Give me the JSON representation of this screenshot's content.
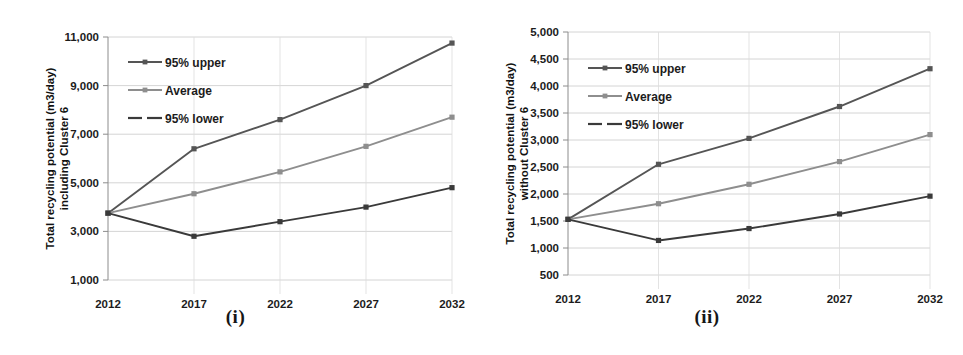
{
  "figure": {
    "panels": [
      {
        "caption": "(i)",
        "ylabel_line1": "Total recycling potential (m3/day)",
        "ylabel_line2": "including Cluster 6",
        "xlabel": "Year"
      },
      {
        "caption": "(ii)",
        "ylabel_line1": "Total recycling potential (m3/day)",
        "ylabel_line2": "without Cluster 6",
        "xlabel": "Year"
      }
    ]
  },
  "chart_data": [
    {
      "type": "line",
      "title": "(i)",
      "xlabel": "Year",
      "ylabel": "Total recycling potential (m3/day) including Cluster 6",
      "categories": [
        "2012",
        "2017",
        "2022",
        "2027",
        "2032"
      ],
      "x": [
        2012,
        2017,
        2022,
        2027,
        2032
      ],
      "ylim": [
        1000,
        11000
      ],
      "yticks": [
        1000,
        3000,
        5000,
        7000,
        9000,
        11000
      ],
      "ytick_labels": [
        "1,000",
        "3,000",
        "5,000",
        "7,000",
        "9,000",
        "11,000"
      ],
      "grid": true,
      "legend_position": "upper-left",
      "series": [
        {
          "name": "95% upper",
          "color": "#555555",
          "values": [
            3750,
            6400,
            7600,
            9000,
            10750
          ]
        },
        {
          "name": "Average",
          "color": "#8e8e8e",
          "values": [
            3750,
            4550,
            5450,
            6500,
            7700
          ]
        },
        {
          "name": "95% lower",
          "color": "#3a3a3a",
          "values": [
            3750,
            2800,
            3400,
            4000,
            4800
          ]
        }
      ]
    },
    {
      "type": "line",
      "title": "(ii)",
      "xlabel": "Year",
      "ylabel": "Total recycling potential (m3/day) without Cluster 6",
      "categories": [
        "2012",
        "2017",
        "2022",
        "2027",
        "2032"
      ],
      "x": [
        2012,
        2017,
        2022,
        2027,
        2032
      ],
      "ylim": [
        500,
        5000
      ],
      "yticks": [
        500,
        1000,
        1500,
        2000,
        2500,
        3000,
        3500,
        4000,
        4500,
        5000
      ],
      "ytick_labels": [
        "500",
        "1,000",
        "1,500",
        "2,000",
        "2,500",
        "3,000",
        "3,500",
        "4,000",
        "4,500",
        "5,000"
      ],
      "grid": true,
      "legend_position": "upper-left",
      "series": [
        {
          "name": "95% upper",
          "color": "#555555",
          "values": [
            1530,
            2550,
            3030,
            3620,
            4320
          ]
        },
        {
          "name": "Average",
          "color": "#8e8e8e",
          "values": [
            1530,
            1820,
            2180,
            2600,
            3100
          ]
        },
        {
          "name": "95% lower",
          "color": "#3a3a3a",
          "values": [
            1530,
            1140,
            1360,
            1630,
            1960
          ]
        }
      ]
    }
  ]
}
